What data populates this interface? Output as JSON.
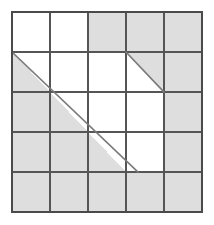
{
  "figure": {
    "type": "grid-shading-diagram",
    "canvas": {
      "width": 214,
      "height": 225,
      "background": "#ffffff"
    },
    "grid": {
      "columns": 5,
      "rows": 5,
      "origin_x": 12,
      "origin_y": 12,
      "cell_width": 38,
      "cell_height": 40,
      "right_x": 202,
      "bottom_y": 212,
      "x_lines": [
        12,
        50,
        88,
        126,
        164,
        202
      ],
      "y_lines": [
        12,
        52,
        92,
        132,
        172,
        212
      ]
    },
    "colors": {
      "shaded_fill": "#dedede",
      "unshaded_fill": "#ffffff",
      "grid_line": "#555555",
      "border_line": "#4a4a4a",
      "diagonal_line": "#7a7a7a"
    },
    "line_widths": {
      "grid_line": 1.6,
      "border_line": 1.8,
      "diagonal_line": 1.6
    },
    "cells": [
      {
        "col": 0,
        "row": 0,
        "state": "unshaded"
      },
      {
        "col": 1,
        "row": 0,
        "state": "unshaded"
      },
      {
        "col": 2,
        "row": 0,
        "state": "shaded"
      },
      {
        "col": 3,
        "row": 0,
        "state": "shaded"
      },
      {
        "col": 4,
        "row": 0,
        "state": "shaded"
      },
      {
        "col": 0,
        "row": 1,
        "state": "half-lower-left"
      },
      {
        "col": 1,
        "row": 1,
        "state": "unshaded"
      },
      {
        "col": 2,
        "row": 1,
        "state": "unshaded"
      },
      {
        "col": 3,
        "row": 1,
        "state": "half-upper-right"
      },
      {
        "col": 4,
        "row": 1,
        "state": "shaded"
      },
      {
        "col": 0,
        "row": 2,
        "state": "shaded"
      },
      {
        "col": 1,
        "row": 2,
        "state": "half-lower-left"
      },
      {
        "col": 2,
        "row": 2,
        "state": "unshaded"
      },
      {
        "col": 3,
        "row": 2,
        "state": "unshaded"
      },
      {
        "col": 4,
        "row": 2,
        "state": "shaded"
      },
      {
        "col": 0,
        "row": 3,
        "state": "shaded"
      },
      {
        "col": 1,
        "row": 3,
        "state": "shaded"
      },
      {
        "col": 2,
        "row": 3,
        "state": "half-lower-left"
      },
      {
        "col": 3,
        "row": 3,
        "state": "unshaded"
      },
      {
        "col": 4,
        "row": 3,
        "state": "shaded"
      },
      {
        "col": 0,
        "row": 4,
        "state": "shaded"
      },
      {
        "col": 1,
        "row": 4,
        "state": "shaded"
      },
      {
        "col": 2,
        "row": 4,
        "state": "shaded"
      },
      {
        "col": 3,
        "row": 4,
        "state": "shaded"
      },
      {
        "col": 4,
        "row": 4,
        "state": "shaded"
      }
    ],
    "diagonals": [
      {
        "name": "main-staircase-diagonal",
        "x1": 12,
        "y1": 52,
        "x2": 138,
        "y2": 172,
        "spans_cells": [
          [
            0,
            1
          ],
          [
            1,
            2
          ],
          [
            2,
            3
          ]
        ]
      },
      {
        "name": "upper-right-diagonal",
        "x1": 126,
        "y1": 52,
        "x2": 164,
        "y2": 92,
        "spans_cells": [
          [
            3,
            1
          ]
        ]
      }
    ]
  }
}
